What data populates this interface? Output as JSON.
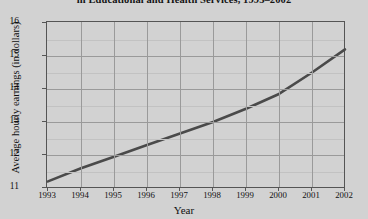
{
  "chart_data": {
    "type": "line",
    "title": "in Educational and Health Services, 1993–2002",
    "xlabel": "Year",
    "ylabel": "Average hourly earnings (in dollars)",
    "categories": [
      "1993",
      "1994",
      "1995",
      "1996",
      "1997",
      "1998",
      "1999",
      "2000",
      "2001",
      "2002"
    ],
    "x": [
      1993,
      1994,
      1995,
      1996,
      1997,
      1998,
      1999,
      2000,
      2001,
      2002
    ],
    "values": [
      11.2,
      11.6,
      11.95,
      12.3,
      12.65,
      13.0,
      13.4,
      13.85,
      14.5,
      15.2
    ],
    "series": [
      {
        "name": "Average hourly earnings",
        "values": [
          11.2,
          11.6,
          11.95,
          12.3,
          12.65,
          13.0,
          13.4,
          13.85,
          14.5,
          15.2
        ]
      }
    ],
    "ylim": [
      11,
      16
    ],
    "xlim": [
      1993,
      2002
    ],
    "yticks": [
      11,
      12,
      13,
      14,
      15,
      16
    ],
    "ytick_labels": [
      "11",
      "12",
      "13",
      "14",
      "15",
      "16"
    ],
    "y_minor_step": 0.5,
    "xticks": [
      1993,
      1994,
      1995,
      1996,
      1997,
      1998,
      1999,
      2000,
      2001,
      2002
    ],
    "grid": true,
    "legend": false,
    "line_color": "#4a4a4a",
    "grid_color": "#9a9a9a",
    "minor_grid_color": "#c2c2c2",
    "plot_background": "#d2d2d2",
    "axis_color": "#555555"
  }
}
